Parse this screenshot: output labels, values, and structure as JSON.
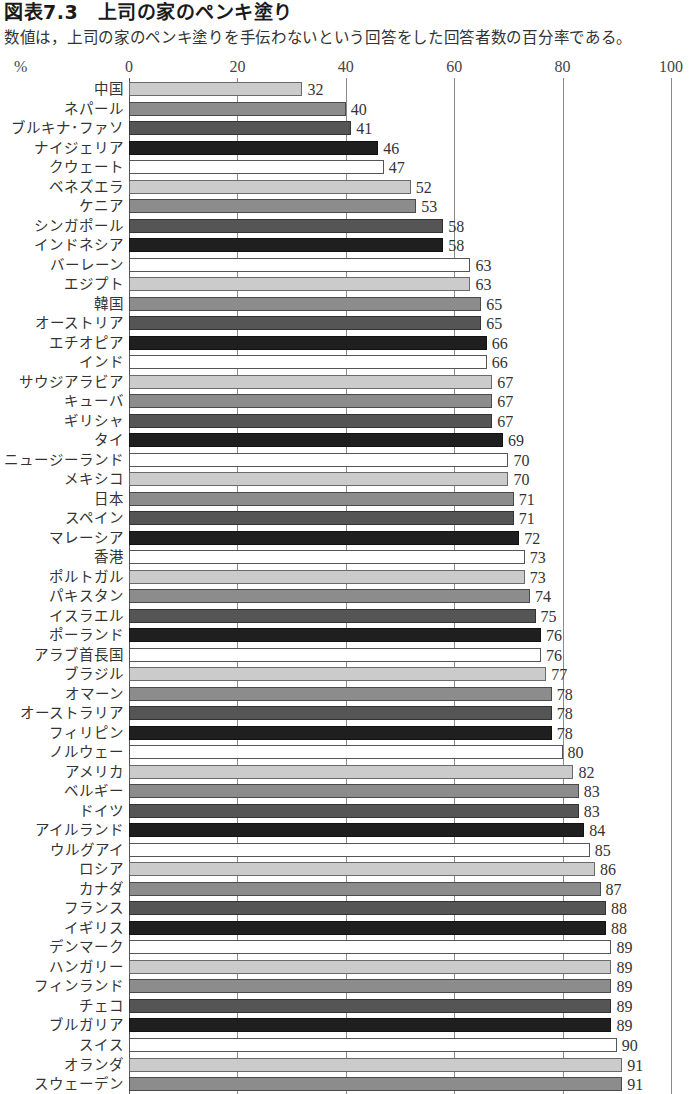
{
  "header": {
    "title": "図表7.3　上司の家のペンキ塗り",
    "subtitle": "数値は，上司の家のペンキ塗りを手伝わないという回答をした回答者数の百分率である。"
  },
  "axis": {
    "unit": "%",
    "ticks": [
      "0",
      "20",
      "40",
      "60",
      "80",
      "100"
    ]
  },
  "colors": [
    "#cbcbcb",
    "#8c8c8c",
    "#555555",
    "#1f1f1f",
    "#ffffff"
  ],
  "chart_data": {
    "type": "bar",
    "orientation": "horizontal",
    "title": "図表7.3　上司の家のペンキ塗り",
    "subtitle": "数値は，上司の家のペンキ塗りを手伝わないという回答をした回答者数の百分率である。",
    "xlabel": "%",
    "ylabel": "",
    "xlim": [
      0,
      100
    ],
    "xticks": [
      0,
      20,
      40,
      60,
      80,
      100
    ],
    "grid": true,
    "legend": null,
    "categories": [
      "中国",
      "ネパール",
      "ブルキナ･ファソ",
      "ナイジェリア",
      "クウェート",
      "ベネズエラ",
      "ケニア",
      "シンガポール",
      "インドネシア",
      "バーレーン",
      "エジプト",
      "韓国",
      "オーストリア",
      "エチオピア",
      "インド",
      "サウジアラビア",
      "キューバ",
      "ギリシャ",
      "タイ",
      "ニュージーランド",
      "メキシコ",
      "日本",
      "スペイン",
      "マレーシア",
      "香港",
      "ポルトガル",
      "パキスタン",
      "イスラエル",
      "ポーランド",
      "アラブ首長国",
      "ブラジル",
      "オマーン",
      "オーストラリア",
      "フィリピン",
      "ノルウェー",
      "アメリカ",
      "ベルギー",
      "ドイツ",
      "アイルランド",
      "ウルグアイ",
      "ロシア",
      "カナダ",
      "フランス",
      "イギリス",
      "デンマーク",
      "ハンガリー",
      "フィンランド",
      "チェコ",
      "ブルガリア",
      "スイス",
      "オランダ",
      "スウェーデン"
    ],
    "values": [
      32,
      40,
      41,
      46,
      47,
      52,
      53,
      58,
      58,
      63,
      63,
      65,
      65,
      66,
      66,
      67,
      67,
      67,
      69,
      70,
      70,
      71,
      71,
      72,
      73,
      73,
      74,
      75,
      76,
      76,
      77,
      78,
      78,
      78,
      80,
      82,
      83,
      83,
      84,
      85,
      86,
      87,
      88,
      88,
      89,
      89,
      89,
      89,
      89,
      90,
      91,
      91
    ]
  }
}
